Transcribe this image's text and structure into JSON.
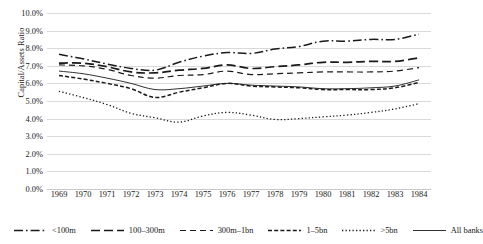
{
  "chart_data": {
    "type": "line",
    "title": "",
    "xlabel": "",
    "ylabel": "Capital/Assets Ratio",
    "ylim": [
      0,
      10
    ],
    "ytick_labels": [
      "0.0%",
      "1.0%",
      "2.0%",
      "3.0%",
      "4.0%",
      "5.0%",
      "6.0%",
      "7.0%",
      "8.0%",
      "9.0%",
      "10.0%"
    ],
    "ytick_values": [
      0,
      1,
      2,
      3,
      4,
      5,
      6,
      7,
      8,
      9,
      10
    ],
    "grid": true,
    "legend_position": "bottom",
    "categories": [
      "1969",
      "1970",
      "1971",
      "1972",
      "1973",
      "1974",
      "1975",
      "1976",
      "1977",
      "1978",
      "1979",
      "1980",
      "1981",
      "1982",
      "1983",
      "1984"
    ],
    "x": [
      1969,
      1970,
      1971,
      1972,
      1973,
      1974,
      1975,
      1976,
      1977,
      1978,
      1979,
      1980,
      1981,
      1982,
      1983,
      1984
    ],
    "series": [
      {
        "name": "<100m",
        "style": "dash-dot",
        "values": [
          7.65,
          7.4,
          7.1,
          6.85,
          6.75,
          7.2,
          7.55,
          7.75,
          7.7,
          7.95,
          8.1,
          8.4,
          8.4,
          8.5,
          8.5,
          8.8
        ]
      },
      {
        "name": "100–300m",
        "style": "long-dash",
        "values": [
          7.15,
          7.15,
          6.95,
          6.65,
          6.6,
          6.75,
          6.85,
          7.05,
          6.85,
          6.95,
          7.05,
          7.2,
          7.2,
          7.25,
          7.25,
          7.45
        ]
      },
      {
        "name": "300m–1bn",
        "style": "medium-dash",
        "values": [
          7.05,
          7.0,
          6.8,
          6.45,
          6.3,
          6.45,
          6.5,
          6.7,
          6.5,
          6.55,
          6.6,
          6.65,
          6.65,
          6.65,
          6.7,
          6.9
        ]
      },
      {
        "name": "1–5bn",
        "style": "short-dash",
        "values": [
          6.45,
          6.25,
          6.0,
          5.7,
          5.2,
          5.5,
          5.75,
          6.0,
          5.85,
          5.8,
          5.75,
          5.65,
          5.65,
          5.65,
          5.75,
          6.05
        ]
      },
      {
        "name": ">5bn",
        "style": "dotted",
        "values": [
          5.55,
          5.2,
          4.8,
          4.3,
          4.05,
          3.8,
          4.15,
          4.35,
          4.2,
          3.95,
          4.0,
          4.1,
          4.2,
          4.35,
          4.55,
          4.85
        ]
      },
      {
        "name": "All banks",
        "style": "solid",
        "values": [
          6.7,
          6.55,
          6.3,
          6.0,
          5.65,
          5.7,
          5.85,
          6.0,
          5.9,
          5.85,
          5.8,
          5.7,
          5.7,
          5.75,
          5.85,
          6.2
        ]
      }
    ]
  }
}
